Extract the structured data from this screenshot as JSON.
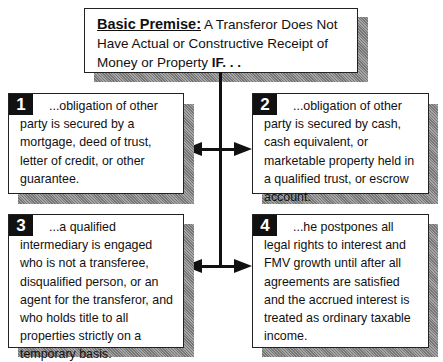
{
  "premise": {
    "lead": "Basic Premise:",
    "text_1": " A Transferor Does Not Have Actual or Constructive Receipt of Money or Property ",
    "if": "IF. . ."
  },
  "conditions": [
    {
      "number": "1",
      "text": "...obligation of other party is secured by a mortgage, deed of trust, letter of credit, or other guarantee."
    },
    {
      "number": "2",
      "text": "...obligation of other party is secured by cash, cash equivalent, or marketable property held in a qualified trust, or escrow account."
    },
    {
      "number": "3",
      "text": "...a qualified intermediary is engaged who is not a transferee, disqualified person, or an agent for the transferor, and who holds title to all properties strictly on a temporary basis."
    },
    {
      "number": "4",
      "text": "...he postpones all legal rights to interest and FMV growth until after all agreements are satisfied and the accrued interest is treated as ordinary taxable income."
    }
  ]
}
